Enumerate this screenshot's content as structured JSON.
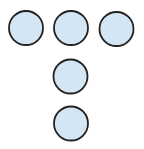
{
  "diagram": {
    "type": "circle-arrangement",
    "fill_color": "#d4e6f4",
    "stroke_color": "#222222",
    "stroke_width": 1.8,
    "radius": 17,
    "circles": [
      {
        "id": "top-left",
        "cx": 26,
        "cy": 28
      },
      {
        "id": "top-middle",
        "cx": 71,
        "cy": 28
      },
      {
        "id": "top-right",
        "cx": 116.5,
        "cy": 29
      },
      {
        "id": "middle",
        "cx": 70.5,
        "cy": 76.5
      },
      {
        "id": "bottom",
        "cx": 71,
        "cy": 123.5
      }
    ]
  }
}
